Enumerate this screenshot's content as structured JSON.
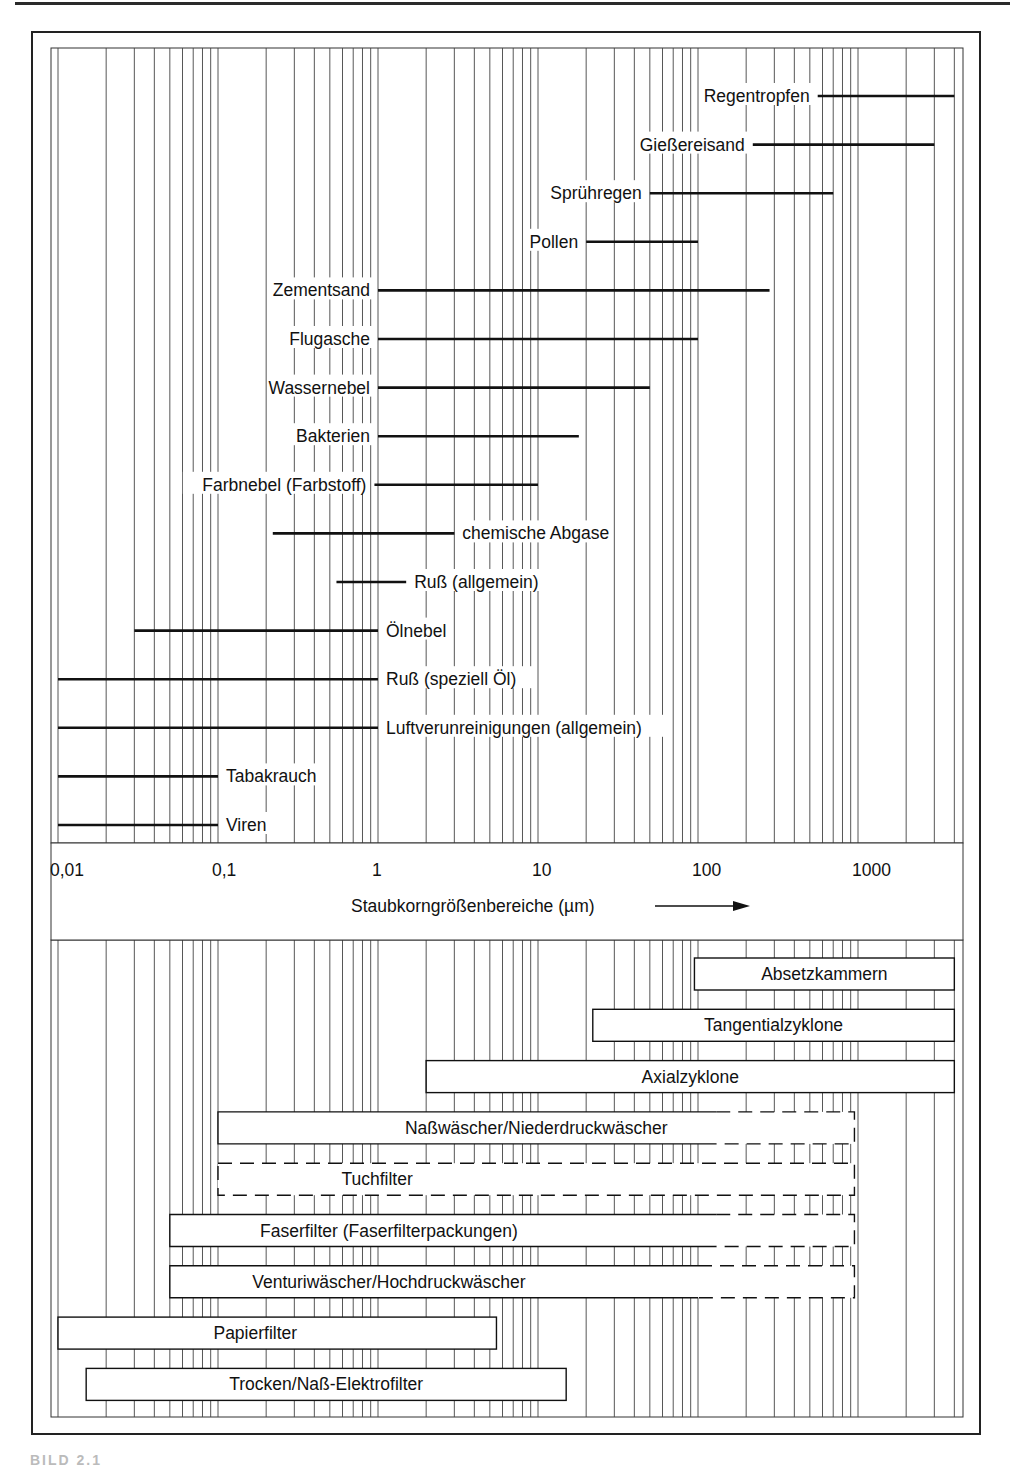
{
  "chart_data": {
    "type": "range-bar",
    "title": "",
    "xlabel": "Staubkorngrößenbereiche (µm)",
    "xscale": "log",
    "xlim": [
      0.01,
      4000
    ],
    "tick_values": [
      0.01,
      0.1,
      1,
      10,
      100,
      1000
    ],
    "tick_labels": [
      "0,01",
      "0,1",
      "1",
      "10",
      "100",
      "1000"
    ],
    "grid": true,
    "upper_panel": {
      "description": "Particle size ranges of dusts/aerosols",
      "series": [
        {
          "name": "Regentropfen",
          "min": 560,
          "max": 4000,
          "label_side": "left"
        },
        {
          "name": "Gießereisand",
          "min": 220,
          "max": 3000,
          "label_side": "left"
        },
        {
          "name": "Sprühregen",
          "min": 50,
          "max": 700,
          "label_side": "left"
        },
        {
          "name": "Pollen",
          "min": 20,
          "max": 100,
          "label_side": "left"
        },
        {
          "name": "Zementsand",
          "min": 1,
          "max": 280,
          "label_side": "left"
        },
        {
          "name": "Flugasche",
          "min": 1,
          "max": 100,
          "label_side": "left"
        },
        {
          "name": "Wassernebel",
          "min": 1,
          "max": 50,
          "label_side": "left"
        },
        {
          "name": "Bakterien",
          "min": 1,
          "max": 18,
          "label_side": "left"
        },
        {
          "name": "Farbnebel (Farbstoff)",
          "min": 0.95,
          "max": 10,
          "label_side": "left"
        },
        {
          "name": "chemische Abgase",
          "min": 0.22,
          "max": 3,
          "label_side": "right"
        },
        {
          "name": "Ruß (allgemein)",
          "min": 0.55,
          "max": 1.5,
          "label_side": "right"
        },
        {
          "name": "Ölnebel",
          "min": 0.03,
          "max": 1,
          "label_side": "right"
        },
        {
          "name": "Ruß (speziell Öl)",
          "min": 0.01,
          "max": 1,
          "label_side": "right"
        },
        {
          "name": "Luftverunreinigungen (allgemein)",
          "min": 0.01,
          "max": 1,
          "label_side": "right"
        },
        {
          "name": "Tabakrauch",
          "min": 0.01,
          "max": 0.1,
          "label_side": "right"
        },
        {
          "name": "Viren",
          "min": 0.01,
          "max": 0.1,
          "label_side": "right"
        }
      ]
    },
    "lower_panel": {
      "description": "Application ranges of dust separators",
      "series": [
        {
          "name": "Absetzkammern",
          "min": 95,
          "max": 4000,
          "dashed_from": null,
          "dashed_all": false,
          "label_x": 0.5
        },
        {
          "name": "Tangentialzyklone",
          "min": 22,
          "max": 4000,
          "dashed_from": null,
          "dashed_all": false,
          "label_x": 0.5
        },
        {
          "name": "Axialzyklone",
          "min": 2,
          "max": 4000,
          "dashed_from": null,
          "dashed_all": false,
          "label_x": 0.5
        },
        {
          "name": "Naßwäscher/Niederdruckwäscher",
          "min": 0.1,
          "max": 950,
          "dashed_from": 130,
          "dashed_all": false,
          "label_x": 0.5
        },
        {
          "name": "Tuchfilter",
          "min": 0.1,
          "max": 950,
          "dashed_from": 0.1,
          "dashed_all": true,
          "label_x": 0.25
        },
        {
          "name": "Faserfilter (Faserfilterpackungen)",
          "min": 0.05,
          "max": 950,
          "dashed_from": 130,
          "dashed_all": false,
          "label_x": 0.32
        },
        {
          "name": "Venturiwäscher/Hochdruckwäscher",
          "min": 0.05,
          "max": 950,
          "dashed_from": 100,
          "dashed_all": false,
          "label_x": 0.32
        },
        {
          "name": "Papierfilter",
          "min": 0.01,
          "max": 5.5,
          "dashed_from": null,
          "dashed_all": false,
          "label_x": 0.45
        },
        {
          "name": "Trocken/Naß-Elektrofilter",
          "min": 0.015,
          "max": 15,
          "dashed_from": null,
          "dashed_all": false,
          "label_x": 0.5
        }
      ]
    }
  },
  "figure": {
    "caption_fragment": "BILD 2.1"
  }
}
